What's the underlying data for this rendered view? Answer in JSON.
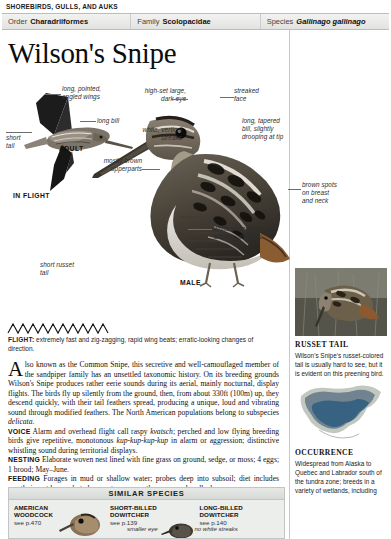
{
  "running_head": "SHOREBIRDS, GULLS, AND AUKS",
  "taxonomy": {
    "order_label": "Order",
    "order_value": "Charadriiformes",
    "family_label": "Family",
    "family_value": "Scolopacidae",
    "species_label": "Species",
    "species_value": "Gallinago gallinago"
  },
  "title": "Wilson's Snipe",
  "plate": {
    "callouts": [
      {
        "id": "long-pointed-angled-wings",
        "text": "long, pointed,\nangled wings"
      },
      {
        "id": "long-bill",
        "text": "long bill"
      },
      {
        "id": "short-tail",
        "text": "short\ntail"
      },
      {
        "id": "high-set-large-dark-eye",
        "text": "high-set large,\ndark eye"
      },
      {
        "id": "streaked-face",
        "text": "streaked\nface"
      },
      {
        "id": "long-tapered-bill",
        "text": "long, tapered\nbill, slightly\ndrooping at tip"
      },
      {
        "id": "white-vertical-streaks",
        "text": "white, vertical\nstreaks"
      },
      {
        "id": "mostly-brown-upperparts",
        "text": "mostly brown\nupperparts"
      },
      {
        "id": "brown-spots-on-breast-and-neck",
        "text": "brown spots\non breast\nand neck"
      },
      {
        "id": "white-underparts-with-barring",
        "text": "white underparts with\nbarring on flanks"
      },
      {
        "id": "short-russet-tail",
        "text": "short russet\ntail"
      }
    ],
    "stage_adult": "ADULT",
    "stage_in_flight": "IN FLIGHT",
    "stage_male": "MALE"
  },
  "flight_note": {
    "lead": "FLIGHT:",
    "text": " extremely fast and zig-zagging, rapid wing beats; erratic-looking changes of direction."
  },
  "main_text": {
    "dropcap": "A",
    "para1": "lso known as the Common Snipe, this secretive and well-camouflaged member of the sandpiper family has an unsettled taxonomic history. On its breeding grounds Wilson's Snipe produces rather eerie sounds during its aerial, mainly nocturnal, display flights. The birds fly up silently from the ground, then, from about 330ft (100m) up, they descend quickly, with their tail feathers spread, producing a unique, loud and vibrating sound through modified feathers. The North American populations belong to subspecies ",
    "para1_italic_end": "delicata",
    "para1_end": ".",
    "voice_label": "VOICE",
    "voice_text_a": " Alarm and overhead flight call raspy ",
    "voice_call_a": "kvatsch",
    "voice_text_b": "; perched and low flying breeding birds give repetitive, monotonous ",
    "voice_call_b": "kup-kup-kup-kup",
    "voice_text_c": " in alarm or aggression; distinctive whistling sound during territorial displays.",
    "nesting_label": "NESTING",
    "nesting_text": " Elaborate woven nest lined with fine grass on ground, sedge, or moss; 4 eggs; 1 brood; May–June.",
    "feeding_label": "FEEDING",
    "feeding_text": " Forages in mud or shallow water; probes deep into subsoil; diet includes mostly insect larvae, but also crustaceans, earthworms, and mollusks."
  },
  "similar_species": {
    "heading": "SIMILAR SPECIES",
    "items": [
      {
        "name": "AMERICAN\nWOODCOCK",
        "page": "see p.470",
        "note": ""
      },
      {
        "name": "SHORT-BILLED DOWITCHER",
        "page": "see p.139",
        "note": "smaller eye"
      },
      {
        "name": "LONG-BILLED DOWITCHER",
        "page": "see p.140",
        "note": "no white streaks"
      }
    ]
  },
  "side": {
    "russet": {
      "heading": "RUSSET TAIL",
      "body": "Wilson's Snipe's russet-colored tail is usually hard to see, but it is evident on this preening bird."
    },
    "occurrence": {
      "heading": "OCCURRENCE",
      "body": "Widespread from Alaska to Quebec and Labrador south of the tundra zone; breeds in a variety of wetlands, including"
    }
  }
}
